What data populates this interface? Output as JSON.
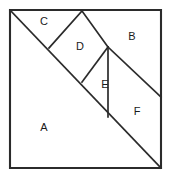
{
  "figure": {
    "kind": "geometric-dissection-diagram",
    "canvas": {
      "width": 171,
      "height": 180
    },
    "colors": {
      "background": "#ffffff",
      "stroke": "#2b2b2b",
      "fill": "#ffffff",
      "label": "#1a1a1a"
    },
    "outer_square": {
      "name": "outer-square",
      "points": "10,10 161,10 161,168 10,168"
    },
    "regions": [
      {
        "id": "A",
        "label": "A",
        "shape": "triangle",
        "points": "10,10 161,168 10,168",
        "label_x": 44,
        "label_y": 128
      },
      {
        "id": "B",
        "label": "B",
        "shape": "quadrilateral",
        "points": "82,11 161,10 161,97 108,47",
        "label_x": 132,
        "label_y": 37
      },
      {
        "id": "C",
        "label": "C",
        "shape": "triangle",
        "points": "10,10 82,11 49,48",
        "label_x": 44,
        "label_y": 22
      },
      {
        "id": "D",
        "label": "D",
        "shape": "quadrilateral",
        "points": "82,11 108,47 82,82 49,48",
        "label_x": 80,
        "label_y": 47
      },
      {
        "id": "E",
        "label": "E",
        "shape": "triangle",
        "points": "108,47 108,117 82,82",
        "label_x": 105,
        "label_y": 85
      },
      {
        "id": "F",
        "label": "F",
        "shape": "quadrilateral",
        "points": "108,47 161,97 161,168 108,117",
        "label_x": 137,
        "label_y": 112
      }
    ],
    "segments": [
      {
        "name": "main-diagonal",
        "x1": 10,
        "y1": 10,
        "x2": 161,
        "y2": 168
      },
      {
        "name": "segment-c-d",
        "x1": 82,
        "y1": 11,
        "x2": 49,
        "y2": 48
      },
      {
        "name": "segment-d-b",
        "x1": 82,
        "y1": 11,
        "x2": 108,
        "y2": 47
      },
      {
        "name": "segment-d-e",
        "x1": 108,
        "y1": 47,
        "x2": 82,
        "y2": 82
      },
      {
        "name": "segment-b-f",
        "x1": 108,
        "y1": 47,
        "x2": 161,
        "y2": 97
      },
      {
        "name": "segment-e-f-vertical",
        "x1": 108,
        "y1": 47,
        "x2": 108,
        "y2": 117
      }
    ]
  }
}
